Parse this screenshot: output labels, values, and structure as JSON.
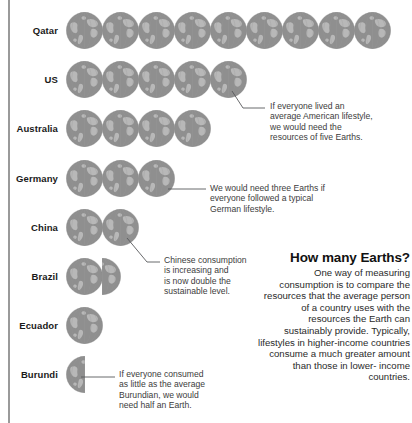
{
  "chart_data": {
    "type": "bar",
    "title": "How many Earths?",
    "xlabel": "Number of Earths required",
    "ylabel": "Country",
    "unit": "Earths",
    "categories": [
      "Qatar",
      "US",
      "Australia",
      "Germany",
      "China",
      "Brazil",
      "Ecuador",
      "Burundi"
    ],
    "values": [
      9,
      5,
      4,
      3,
      2,
      1.5,
      1,
      0.5
    ],
    "icon": "earth-globe",
    "icon_value": 1,
    "grid": false,
    "legend": false,
    "xlim": [
      0,
      9
    ]
  },
  "rows": [
    {
      "label": "Qatar",
      "earths": 9,
      "full": 9,
      "half": false
    },
    {
      "label": "US",
      "earths": 5,
      "full": 5,
      "half": false
    },
    {
      "label": "Australia",
      "earths": 4,
      "full": 4,
      "half": false
    },
    {
      "label": "Germany",
      "earths": 3,
      "full": 3,
      "half": false
    },
    {
      "label": "China",
      "earths": 2,
      "full": 2,
      "half": false
    },
    {
      "label": "Brazil",
      "earths": 1.5,
      "full": 1,
      "half": "right"
    },
    {
      "label": "Ecuador",
      "earths": 1,
      "full": 1,
      "half": false
    },
    {
      "label": "Burundi",
      "earths": 0.5,
      "full": 0,
      "half": "left"
    }
  ],
  "annotations": {
    "us": "If everyone lived an\naverage American lifestyle,\nwe would need the\nresources of five Earths.",
    "germany": "We would need three Earths if\neveryone followed a typical\nGerman lifestyle.",
    "china": "Chinese consumption\nis increasing and\nis now double the\nsustainable level.",
    "burundi": "If everyone consumed\nas little as the average\nBurundian, we would\nneed half an Earth."
  },
  "panel": {
    "heading": "How many Earths?",
    "body": "One way of measuring consumption is to compare the resources that the average person of a country uses with the resources the Earth can sustainably provide. Typically, lifestyles in higher-income countries consume a much greater amount than those in lower- income countries."
  },
  "colors": {
    "globe_ocean": "#8f8f8f",
    "globe_land": "#b6b6b6",
    "rule": "#9a9a9a",
    "text": "#231f20",
    "annotation_text": "#3c3c3c",
    "leader_line": "#58595b"
  }
}
